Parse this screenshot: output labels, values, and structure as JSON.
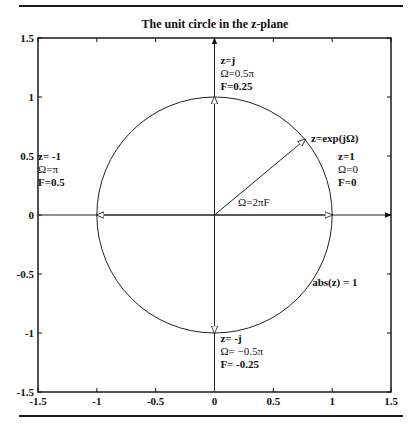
{
  "chart_data": {
    "type": "line",
    "title": "The unit circle in the z-plane",
    "xlabel": "",
    "ylabel": "",
    "xlim": [
      -1.5,
      1.5
    ],
    "ylim": [
      -1.5,
      1.5
    ],
    "grid": false,
    "legend": null,
    "xticks": [
      "-1.5",
      "-1",
      "-0.5",
      "0",
      "0.5",
      "1",
      "1.5"
    ],
    "yticks": [
      "1.5",
      "1",
      "0.5",
      "0",
      "-0.5",
      "-1",
      "-1.5"
    ],
    "xtick_values": [
      -1.5,
      -1,
      -0.5,
      0,
      0.5,
      1,
      1.5
    ],
    "ytick_values": [
      1.5,
      1,
      0.5,
      0,
      -0.5,
      -1,
      -1.5
    ],
    "series": [
      {
        "name": "unit circle",
        "shape": "circle",
        "center": [
          0,
          0
        ],
        "radius": 1
      },
      {
        "name": "real axis",
        "from": [
          -1.5,
          0
        ],
        "to": [
          1.5,
          0
        ],
        "arrow": "end"
      },
      {
        "name": "imag axis",
        "from": [
          0,
          -1.5
        ],
        "to": [
          0,
          1.5
        ],
        "arrow": "end"
      },
      {
        "name": "vector z=exp(jΩ)",
        "from": [
          0,
          0
        ],
        "to": [
          0.77,
          0.64
        ],
        "arrow": "open"
      },
      {
        "name": "vector to z=1",
        "from": [
          0,
          0
        ],
        "to": [
          1,
          0
        ],
        "arrow": "open"
      },
      {
        "name": "vector to z=-1",
        "from": [
          0,
          0
        ],
        "to": [
          -1,
          0
        ],
        "arrow": "open"
      },
      {
        "name": "vector to z=j",
        "from": [
          0,
          0
        ],
        "to": [
          0,
          1
        ],
        "arrow": "open"
      },
      {
        "name": "vector to z=-j",
        "from": [
          0,
          0
        ],
        "to": [
          0,
          -1
        ],
        "arrow": "open"
      }
    ],
    "annotations": [
      {
        "id": "zj",
        "x": 0.05,
        "y": 1.28,
        "lines": [
          "z=j",
          "Ω=0.5π",
          "F=0.25"
        ]
      },
      {
        "id": "z1",
        "x": 1.05,
        "y": 0.47,
        "lines": [
          "z=1",
          "Ω=0",
          "F=0"
        ]
      },
      {
        "id": "zm1",
        "x": -1.5,
        "y": 0.47,
        "lines": [
          "z= -1",
          "Ω=π",
          "F=0.5"
        ]
      },
      {
        "id": "zmj",
        "x": 0.05,
        "y": -1.08,
        "lines": [
          "z= -j",
          "Ω= −0.5π",
          "F= -0.25"
        ]
      },
      {
        "id": "zexp",
        "x": 0.82,
        "y": 0.62,
        "lines": [
          "z=exp(jΩ)"
        ]
      },
      {
        "id": "omega",
        "x": 0.2,
        "y": 0.08,
        "lines": [
          "Ω=2πF"
        ]
      },
      {
        "id": "abs",
        "x": 0.83,
        "y": -0.6,
        "lines": [
          "abs(z) = 1"
        ]
      }
    ]
  }
}
